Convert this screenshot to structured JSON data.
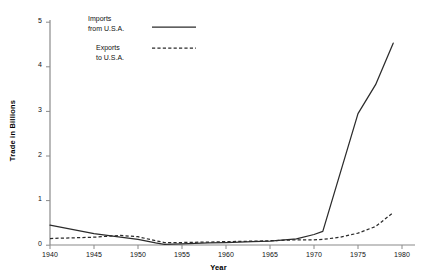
{
  "chart_data": {
    "type": "line",
    "title": "",
    "xlabel": "Year",
    "ylabel": "Trade in Billions",
    "xlim": [
      1940,
      1980
    ],
    "ylim": [
      0,
      5
    ],
    "grid": false,
    "legend_position": "top-left",
    "x_ticks": [
      "1940",
      "1945",
      "1950",
      "1955",
      "1960",
      "1965",
      "1970",
      "1975",
      "1980"
    ],
    "y_ticks": [
      "0",
      "1",
      "2",
      "3",
      "4",
      "5"
    ],
    "series": [
      {
        "name": "Imports from U.S.A.",
        "style": "solid",
        "color": "#2b2b2b",
        "x": [
          1940,
          1945,
          1948,
          1950,
          1952,
          1953,
          1955,
          1958,
          1960,
          1963,
          1965,
          1968,
          1970,
          1971,
          1975,
          1977,
          1979
        ],
        "values": [
          0.45,
          0.26,
          0.18,
          0.13,
          0.05,
          0.02,
          0.03,
          0.05,
          0.06,
          0.08,
          0.09,
          0.14,
          0.24,
          0.31,
          2.95,
          3.6,
          4.53
        ]
      },
      {
        "name": "Exports to U.S.A.",
        "style": "dashed",
        "color": "#2b2b2b",
        "x": [
          1940,
          1945,
          1948,
          1950,
          1952,
          1953,
          1955,
          1958,
          1960,
          1963,
          1965,
          1968,
          1970,
          1971,
          1973,
          1975,
          1977,
          1979
        ],
        "values": [
          0.15,
          0.18,
          0.22,
          0.19,
          0.1,
          0.06,
          0.06,
          0.07,
          0.08,
          0.09,
          0.1,
          0.12,
          0.12,
          0.13,
          0.18,
          0.27,
          0.42,
          0.73
        ]
      }
    ]
  },
  "legend": {
    "imports_line1": "Imports",
    "imports_line2": "from U.S.A.",
    "exports_line1": "Exports",
    "exports_line2": "to U.S.A."
  },
  "axes": {
    "y_title": "Trade in Billions",
    "x_title": "Year",
    "y_tick_0": "0",
    "y_tick_1": "1",
    "y_tick_2": "2",
    "y_tick_3": "3",
    "y_tick_4": "4",
    "y_tick_5": "5",
    "x_tick_1940": "1940",
    "x_tick_1945": "1945",
    "x_tick_1950": "1950",
    "x_tick_1955": "1955",
    "x_tick_1960": "1960",
    "x_tick_1965": "1965",
    "x_tick_1970": "1970",
    "x_tick_1975": "1975",
    "x_tick_1980": "1980"
  },
  "colors": {
    "line": "#2b2b2b",
    "axis": "#8a8a8a",
    "background": "#ffffff"
  }
}
